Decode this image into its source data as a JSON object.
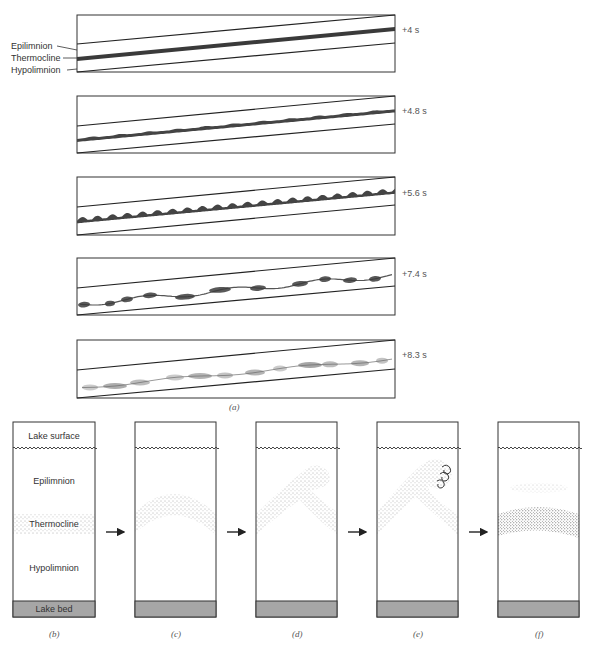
{
  "figure": {
    "part_a": {
      "caption": "(a)",
      "layer_labels": [
        "Epilimnion",
        "Thermocline",
        "Hypolimnion"
      ],
      "panels": [
        {
          "time_label": "+4 s",
          "stage": "flat-sheared-interface"
        },
        {
          "time_label": "+4.8 s",
          "stage": "small-ripples"
        },
        {
          "time_label": "+5.6 s",
          "stage": "growing-billows"
        },
        {
          "time_label": "+7.4 s",
          "stage": "rolled-up-billows"
        },
        {
          "time_label": "+8.3 s",
          "stage": "turbulent-mixing"
        }
      ]
    },
    "part_b_to_f": {
      "panels": [
        {
          "caption": "(b)",
          "stage": "stratified-lake",
          "labels": {
            "surface": "Lake surface",
            "epilimnion": "Epilimnion",
            "thermocline": "Thermocline",
            "hypolimnion": "Hypolimnion",
            "bed": "Lake bed"
          }
        },
        {
          "caption": "(c)",
          "stage": "thermocline-tilts-up"
        },
        {
          "caption": "(d)",
          "stage": "internal-wave-steepens"
        },
        {
          "caption": "(e)",
          "stage": "wave-breaks-with-eddies"
        },
        {
          "caption": "(f)",
          "stage": "mixed-layer-detached"
        }
      ]
    },
    "colors": {
      "frame": "#333333",
      "thermocline_dark": "#3a3a3a",
      "stipple": "#555555",
      "lake_bed": "#a6a6a6",
      "arrow": "#222222"
    }
  }
}
